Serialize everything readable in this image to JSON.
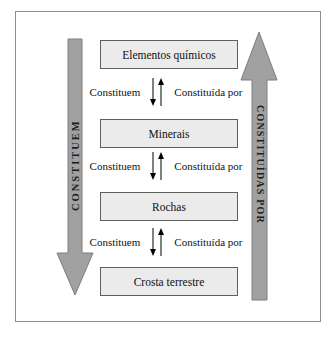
{
  "diagram": {
    "boxes": [
      {
        "label": "Elementos químicos"
      },
      {
        "label": "Minerais"
      },
      {
        "label": "Rochas"
      },
      {
        "label": "Crosta terrestre"
      }
    ],
    "connectors": [
      {
        "left": "Constituem",
        "right": "Constituída por"
      },
      {
        "left": "Constituem",
        "right": "Constituída por"
      },
      {
        "left": "Constituem",
        "right": "Constituída por"
      }
    ],
    "side_arrows": {
      "left": {
        "label": "CONSTITUEM",
        "direction": "down"
      },
      "right": {
        "label": "CONSTITUÍDAS POR",
        "direction": "up"
      }
    },
    "colors": {
      "arrow_fill": "#a1a1a1",
      "arrow_stroke": "#7e7e7e",
      "box_fill": "#ebebeb",
      "box_border": "#5f5f5f",
      "frame_border": "#8f8f8f"
    }
  }
}
